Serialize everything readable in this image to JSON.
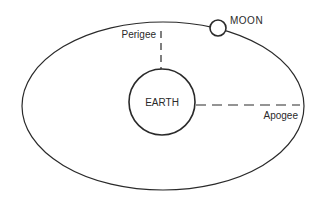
{
  "diagram": {
    "type": "orbit",
    "labels": {
      "earth": "EARTH",
      "moon": "MOON",
      "perigee": "Perigee",
      "apogee": "Apogee"
    },
    "colors": {
      "stroke": "#2a2a2a",
      "background": "#ffffff"
    },
    "geometry": {
      "orbit": {
        "cx": 163,
        "cy": 106,
        "rx": 141,
        "ry": 84
      },
      "earth": {
        "cx": 162,
        "cy": 102,
        "r": 33
      },
      "moon": {
        "cx": 218,
        "cy": 28,
        "r": 8
      },
      "perigee_line": {
        "x": 161,
        "y1": 31,
        "y2": 69
      },
      "apogee_line": {
        "y": 105,
        "x1": 196,
        "x2": 300
      }
    }
  }
}
